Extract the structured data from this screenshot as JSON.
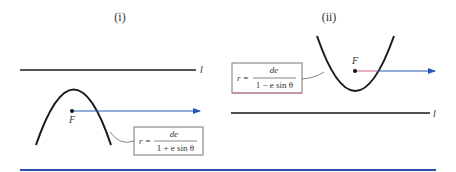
{
  "panels": [
    {
      "label": "(i)",
      "directrix_label": "l",
      "focus_label": "F",
      "equation": {
        "lhs": "r =",
        "numerator": "de",
        "denominator": "1 + e sin θ"
      },
      "opening": "down",
      "directrix_position": "above"
    },
    {
      "label": "(ii)",
      "directrix_label": "l",
      "focus_label": "F",
      "equation": {
        "lhs": "r =",
        "numerator": "de",
        "denominator": "1 − e sin θ"
      },
      "opening": "up",
      "directrix_position": "below"
    }
  ],
  "colors": {
    "curve": "#1a1a1a",
    "directrix": "#1a1a1a",
    "axis_ray": "#2a56b8",
    "axis_ray_near_focus": "#d06080",
    "box_border": "#777777",
    "bottom_rule": "#2a4fa8"
  }
}
